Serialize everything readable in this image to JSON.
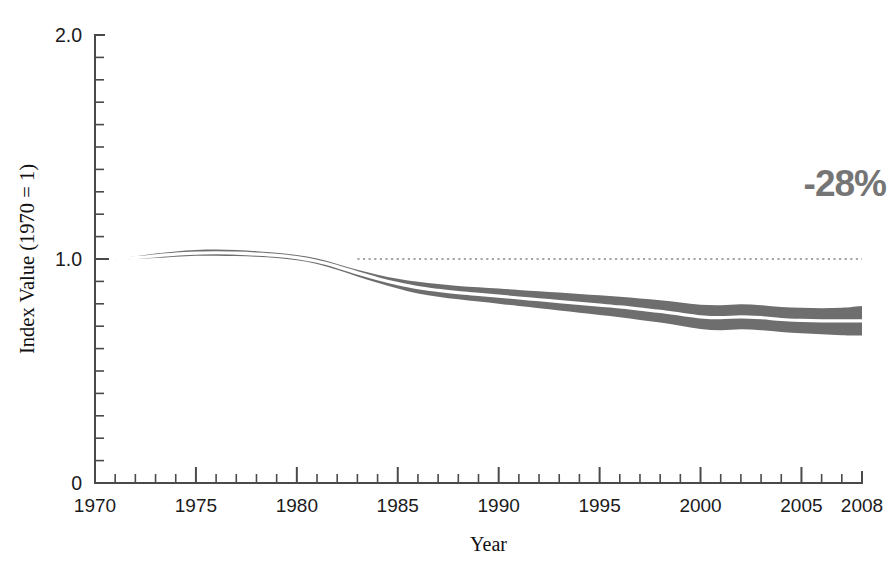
{
  "chart_data": {
    "type": "area",
    "title": "",
    "subtitle": "",
    "xlabel": "Year",
    "ylabel": "Index Value (1970 = 1)",
    "xlim": [
      1970,
      2008
    ],
    "ylim": [
      0,
      2.0
    ],
    "grid": false,
    "legend": null,
    "y_ticks_major": [
      "2.0",
      "1.0",
      "0"
    ],
    "y_tick_values_major": [
      2.0,
      1.0,
      0
    ],
    "y_tick_minor_step": 0.1,
    "x_ticks_major": [
      "1970",
      "1975",
      "1980",
      "1985",
      "1990",
      "1995",
      "2000",
      "2005",
      "2008"
    ],
    "x_tick_values_major": [
      1970,
      1975,
      1980,
      1985,
      1990,
      1995,
      2000,
      2005,
      2008
    ],
    "x_tick_minor_step": 1,
    "band_color": "#6e6e6e",
    "center_line_color": "#ffffff",
    "reference_line": {
      "y": 1.0,
      "x_start": 1983.0,
      "x_end": 2008,
      "style": "dotted",
      "color": "#8a8a8a"
    },
    "annotations": [
      {
        "text": "-28%",
        "x": 2008,
        "y": 1.28,
        "color": "#757575"
      }
    ],
    "x": [
      1971,
      1972,
      1973,
      1974,
      1975,
      1976,
      1977,
      1978,
      1979,
      1980,
      1981,
      1982,
      1983,
      1984,
      1985,
      1986,
      1987,
      1988,
      1989,
      1990,
      1991,
      1992,
      1993,
      1994,
      1995,
      1996,
      1997,
      1998,
      1999,
      2000,
      2001,
      2002,
      2003,
      2004,
      2005,
      2006,
      2007,
      2008
    ],
    "series": [
      {
        "name": "Upper bound",
        "values": [
          1.002,
          1.012,
          1.024,
          1.034,
          1.04,
          1.042,
          1.04,
          1.035,
          1.028,
          1.018,
          1.002,
          0.978,
          0.952,
          0.93,
          0.912,
          0.898,
          0.888,
          0.88,
          0.874,
          0.868,
          0.862,
          0.856,
          0.85,
          0.844,
          0.838,
          0.832,
          0.824,
          0.816,
          0.806,
          0.796,
          0.794,
          0.798,
          0.794,
          0.786,
          0.782,
          0.78,
          0.782,
          0.79
        ]
      },
      {
        "name": "Central estimate",
        "values": [
          1.0,
          1.006,
          1.014,
          1.022,
          1.026,
          1.028,
          1.026,
          1.022,
          1.016,
          1.006,
          0.99,
          0.966,
          0.938,
          0.912,
          0.89,
          0.872,
          0.86,
          0.85,
          0.842,
          0.834,
          0.826,
          0.818,
          0.81,
          0.802,
          0.794,
          0.786,
          0.776,
          0.766,
          0.754,
          0.742,
          0.738,
          0.742,
          0.738,
          0.73,
          0.726,
          0.724,
          0.724,
          0.724
        ]
      },
      {
        "name": "Lower bound",
        "values": [
          0.998,
          1.0,
          1.004,
          1.01,
          1.014,
          1.015,
          1.013,
          1.01,
          1.004,
          0.994,
          0.978,
          0.952,
          0.922,
          0.894,
          0.868,
          0.846,
          0.832,
          0.82,
          0.81,
          0.8,
          0.79,
          0.78,
          0.77,
          0.76,
          0.75,
          0.74,
          0.728,
          0.716,
          0.702,
          0.688,
          0.682,
          0.686,
          0.682,
          0.674,
          0.668,
          0.664,
          0.66,
          0.658
        ]
      }
    ],
    "summary_change_percent": -28
  }
}
